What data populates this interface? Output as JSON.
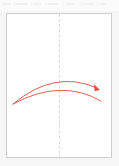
{
  "app": {
    "title": "Canvas",
    "background_color": "#f6f6f6",
    "page_color": "#ffffff",
    "page_border_color": "#cfcfcf"
  },
  "top_strip": {
    "name": "ruler",
    "visible": true,
    "background_color": "#fbfbfb",
    "tick_color": "#f0f0f0"
  },
  "guides": {
    "center_vertical": {
      "label": "center guide",
      "orientation": "vertical",
      "style": "dashed",
      "color": "#d8d8d8",
      "x": 52
    }
  },
  "drawing": {
    "type": "vector-annotation",
    "shape_name": "curved-double-arc-arrow",
    "stroke_color": "#e0503f",
    "arrow_fill_color": "#e0503f",
    "stroke_width": "0.9",
    "arcs": [
      {
        "name": "upper-arc",
        "start": [
          6,
          90
        ],
        "control": [
          48,
          55
        ],
        "end": [
          90,
          74
        ],
        "has_arrowhead": true
      },
      {
        "name": "lower-arc",
        "start": [
          6,
          90
        ],
        "control": [
          54,
          64
        ],
        "end": [
          94,
          87
        ],
        "has_arrowhead": false
      }
    ],
    "arrowhead": {
      "name": "arrow-tip",
      "apex": [
        93,
        76
      ],
      "rotation_deg": 35,
      "size": 6
    }
  }
}
